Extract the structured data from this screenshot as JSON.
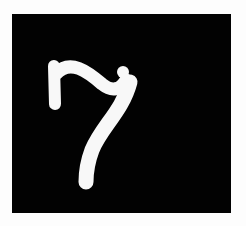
{
  "image": {
    "subject": "7",
    "description": "White hand-drawn stylized numeral seven on a black square",
    "colors": {
      "page_background": "#fdfdfd",
      "panel_background": "#020202",
      "glyph": "#f8f8f8"
    }
  }
}
